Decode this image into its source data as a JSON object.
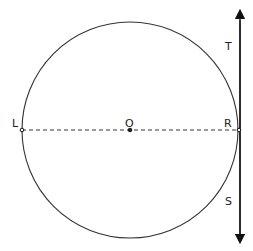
{
  "diagram": {
    "title": "",
    "circle": {
      "cx": 130,
      "cy": 130,
      "r": 108,
      "stroke": "#333333"
    },
    "diameter": {
      "from": "L",
      "to": "R",
      "style": "dashed"
    },
    "tangent_line": {
      "x": 240,
      "y1": 14,
      "y2": 239,
      "arrows": "both"
    },
    "points": [
      {
        "id": "L",
        "label": "L",
        "x": 22,
        "y": 130
      },
      {
        "id": "O",
        "label": "O",
        "x": 130,
        "y": 130
      },
      {
        "id": "R",
        "label": "R",
        "x": 239,
        "y": 130
      }
    ],
    "line_labels": [
      {
        "id": "T",
        "label": "T"
      },
      {
        "id": "S",
        "label": "S"
      }
    ]
  }
}
